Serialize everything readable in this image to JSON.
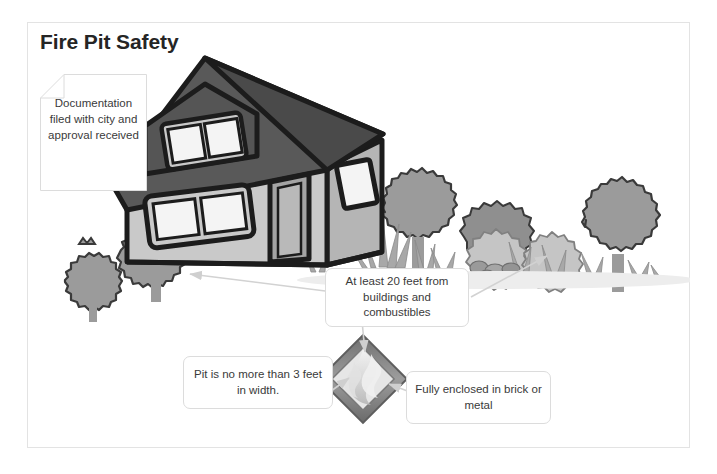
{
  "page": {
    "title": "Fire Pit Safety",
    "background_color": "#ffffff",
    "frame_border_color": "#e3e3e3",
    "title_color": "#252525"
  },
  "callouts": [
    {
      "id": "documentation",
      "shape": "document-folded-corner",
      "text": "Documentation filed with city and approval received"
    },
    {
      "id": "distance",
      "shape": "rounded-rectangle",
      "text": "At least 20 feet from buildings and combustibles"
    },
    {
      "id": "width",
      "shape": "rounded-rectangle",
      "text": "Pit is no more than 3 feet in width."
    },
    {
      "id": "material",
      "shape": "rounded-rectangle",
      "text": "Fully enclosed in brick or metal"
    }
  ],
  "illustration": {
    "description": "Grayscale cartoon yard scene with a house, trees, shrubs, grass, rocks and a square fire pit with flames",
    "objects": [
      {
        "name": "house",
        "detail": "two-story cartoon house with dark roof, dormer window, front window, door and side window"
      },
      {
        "name": "tree-left-large",
        "detail": "scalloped gray tree"
      },
      {
        "name": "tree-left-small",
        "detail": "scalloped gray tree"
      },
      {
        "name": "tree-right-back",
        "detail": "scalloped gray tree"
      },
      {
        "name": "tree-right-tall",
        "detail": "scalloped gray tree"
      },
      {
        "name": "shrub-cluster",
        "detail": "light gray flowering bushes"
      },
      {
        "name": "grass-tufts",
        "detail": "spiky grass blades along the ground"
      },
      {
        "name": "rocks",
        "detail": "cluster of small gray stones"
      },
      {
        "name": "fire-pit",
        "detail": "diamond-oriented square pit with flames"
      }
    ],
    "arrows": [
      {
        "name": "arrow-to-house",
        "direction": "left",
        "from": "distance-callout",
        "to": "house"
      },
      {
        "name": "arrow-to-shrubs",
        "direction": "up-right",
        "from": "distance-callout",
        "to": "shrubs"
      },
      {
        "name": "arrow-to-firepit-left",
        "direction": "up-right",
        "from": "width-callout",
        "to": "fire-pit"
      },
      {
        "name": "arrow-to-firepit-right",
        "direction": "up-left",
        "from": "material-callout",
        "to": "fire-pit"
      },
      {
        "name": "arrow-to-firepit-top",
        "direction": "down",
        "from": "distance-callout",
        "to": "fire-pit"
      }
    ],
    "palette": {
      "outline": "#1c1c1c",
      "roof": "#595959",
      "roof_dark": "#3f3f3f",
      "wall_light": "#c9c9c9",
      "wall_mid": "#a8a8a8",
      "wall_shadow": "#8e8e8e",
      "window": "#f2f2f2",
      "tree": "#9b9b9b",
      "tree_dark": "#848484",
      "shrub_light": "#c5c5c5",
      "grass": "#a5a5a5",
      "rock": "#9a9a9a",
      "arrow": "#d2d2d2",
      "flame": "#d8d8d8"
    }
  }
}
